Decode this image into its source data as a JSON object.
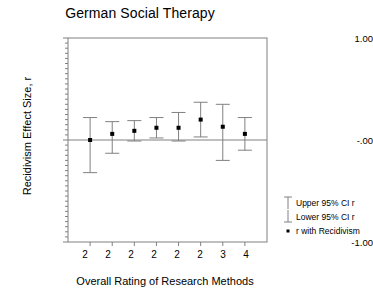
{
  "chart_data": {
    "type": "scatter",
    "title": "German Social Therapy",
    "xlabel": "Overall Rating of Research Methods",
    "ylabel": "Recidivism Effect Size, r",
    "ylim": [
      -1.0,
      1.0
    ],
    "ytick_labels": [
      "1.00",
      "-.00",
      "-1.00"
    ],
    "ytick_values": [
      1.0,
      0.0,
      -1.0
    ],
    "grid": false,
    "zero_reference_line": 0.0,
    "categories": [
      "2",
      "2",
      "2",
      "2",
      "2",
      "2",
      "3",
      "4"
    ],
    "xlabel_values": [
      2,
      2,
      2,
      2,
      2,
      2,
      3,
      4
    ],
    "series": [
      {
        "name": "r with Recidivism",
        "values": [
          0.0,
          0.06,
          0.09,
          0.12,
          0.12,
          0.2,
          0.13,
          0.06
        ]
      },
      {
        "name": "Upper 95% CI r",
        "values": [
          0.22,
          0.18,
          0.19,
          0.22,
          0.27,
          0.37,
          0.35,
          0.22
        ]
      },
      {
        "name": "Lower 95% CI r",
        "values": [
          -0.32,
          -0.13,
          -0.01,
          0.02,
          -0.01,
          0.03,
          -0.2,
          -0.1
        ]
      }
    ],
    "legend_position": "right",
    "legend": [
      {
        "label": "Upper 95% CI r",
        "key": "error-bar-cap-icon"
      },
      {
        "label": "Lower 95% CI r",
        "key": "error-bar-cap-icon"
      },
      {
        "label": "r with Recidivism",
        "key": "point-marker-icon"
      }
    ],
    "colors": {
      "marker": "#000000",
      "errorbar": "#808080",
      "axis": "#808080",
      "text": "#000000"
    }
  }
}
